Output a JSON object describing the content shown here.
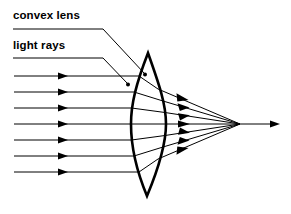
{
  "diagram": {
    "background_color": "#ffffff",
    "stroke_color": "#000000",
    "width": 291,
    "height": 214,
    "labels": [
      {
        "id": "convex-lens",
        "text": "convex lens",
        "x": 13,
        "y": 9,
        "underline": {
          "x1": 13,
          "y1": 29,
          "x2": 103,
          "y2": 29
        },
        "leader": {
          "x1": 103,
          "y1": 29,
          "x2": 145,
          "y2": 74
        },
        "dot": {
          "cx": 145,
          "cy": 75,
          "r": 1.9
        }
      },
      {
        "id": "light-rays",
        "text": "light rays",
        "x": 13,
        "y": 39,
        "underline": {
          "x1": 13,
          "y1": 58,
          "x2": 103,
          "y2": 58
        },
        "leader": {
          "x1": 103,
          "y1": 58,
          "x2": 128,
          "y2": 84
        },
        "dot": {
          "cx": 128,
          "cy": 85,
          "r": 1.9
        }
      }
    ],
    "lens": {
      "name": "biconvex-lens",
      "top_apex": {
        "x": 148,
        "y": 53
      },
      "bottom_apex": {
        "x": 147,
        "y": 196
      },
      "left_surface_vertex_x": 131,
      "right_surface_vertex_x": 166,
      "center_y": 124,
      "stroke_width": 2.6
    },
    "focal_point": {
      "x": 240,
      "y": 124
    },
    "axis_ray_end": {
      "x": 279,
      "y": 124
    },
    "incoming_rays": {
      "count": 7,
      "start_x": 14,
      "arrowhead_x": 67,
      "y_positions": [
        76,
        92,
        108,
        124,
        140,
        156,
        172
      ],
      "entry_x": [
        139,
        134,
        131.5,
        131,
        131.5,
        134,
        139
      ]
    },
    "exit_rays": {
      "count": 7,
      "arrowhead_x": [
        186,
        186,
        186,
        186,
        186,
        186,
        186
      ],
      "exit_x": [
        158,
        163,
        165,
        166,
        165,
        163,
        158
      ],
      "exit_y": [
        76,
        92,
        108,
        124,
        140,
        156,
        172
      ]
    }
  }
}
